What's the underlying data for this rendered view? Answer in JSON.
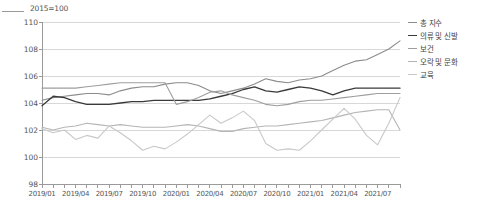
{
  "axis_note": "2015=100",
  "legend": {
    "position": "right-top",
    "items": [
      {
        "label": "총 지수",
        "color": "#8c8c8c"
      },
      {
        "label": "의류 및 신발",
        "color": "#3a3a3a"
      },
      {
        "label": "보건",
        "color": "#9e9e9e"
      },
      {
        "label": "오락 및 문화",
        "color": "#b5b5b5"
      },
      {
        "label": "교육",
        "color": "#c8c8c8"
      }
    ]
  },
  "chart_data": {
    "type": "line",
    "title": "",
    "subtitle": "",
    "xlabel": "",
    "ylabel": "2015=100",
    "ylim": [
      98,
      110
    ],
    "ytick_step": 2,
    "yticks": [
      98,
      100,
      102,
      104,
      106,
      108,
      110
    ],
    "grid": true,
    "legend_position": "right-top",
    "x": [
      "2019/01",
      "2019/02",
      "2019/03",
      "2019/04",
      "2019/05",
      "2019/06",
      "2019/07",
      "2019/08",
      "2019/09",
      "2019/10",
      "2019/11",
      "2019/12",
      "2020/01",
      "2020/02",
      "2020/03",
      "2020/04",
      "2020/05",
      "2020/06",
      "2020/07",
      "2020/08",
      "2020/09",
      "2020/10",
      "2020/11",
      "2020/12",
      "2021/01",
      "2021/02",
      "2021/03",
      "2021/04",
      "2021/05",
      "2021/06",
      "2021/07",
      "2021/08",
      "2021/09"
    ],
    "xtick_labels": [
      "2019/01",
      "2019/04",
      "2019/07",
      "2019/10",
      "2020/01",
      "2020/04",
      "2020/07",
      "2020/10",
      "2021/01",
      "2021/04",
      "2021/07"
    ],
    "series": [
      {
        "name": "총 지수",
        "color": "#8c8c8c",
        "width": 1.1,
        "values": [
          104.2,
          104.4,
          104.5,
          104.6,
          104.7,
          104.7,
          104.6,
          104.9,
          105.1,
          105.2,
          105.2,
          105.4,
          105.5,
          105.5,
          105.3,
          104.9,
          104.7,
          104.9,
          105.1,
          105.4,
          105.8,
          105.6,
          105.5,
          105.7,
          105.8,
          106.0,
          106.4,
          106.8,
          107.1,
          107.2,
          107.6,
          108.0,
          108.6
        ]
      },
      {
        "name": "의류 및 신발",
        "color": "#3a3a3a",
        "width": 1.3,
        "values": [
          103.8,
          104.5,
          104.4,
          104.1,
          103.9,
          103.9,
          103.9,
          104.0,
          104.1,
          104.1,
          104.2,
          104.2,
          104.2,
          104.2,
          104.2,
          104.3,
          104.5,
          104.7,
          105.0,
          105.2,
          104.9,
          104.8,
          105.0,
          105.2,
          105.1,
          104.9,
          104.6,
          104.9,
          105.1,
          105.1,
          105.1,
          105.1,
          105.1
        ]
      },
      {
        "name": "보건",
        "color": "#9e9e9e",
        "width": 1.1,
        "values": [
          105.1,
          105.1,
          105.1,
          105.1,
          105.2,
          105.3,
          105.4,
          105.5,
          105.5,
          105.5,
          105.5,
          105.5,
          103.9,
          104.1,
          104.4,
          104.8,
          104.9,
          104.6,
          104.4,
          104.2,
          103.9,
          103.8,
          103.9,
          104.1,
          104.2,
          104.2,
          104.3,
          104.4,
          104.5,
          104.6,
          104.7,
          104.7,
          104.7
        ]
      },
      {
        "name": "오락 및 문화",
        "color": "#b5b5b5",
        "width": 1.1,
        "values": [
          102.2,
          102.0,
          102.2,
          102.3,
          102.5,
          102.4,
          102.3,
          102.4,
          102.3,
          102.2,
          102.2,
          102.2,
          102.3,
          102.4,
          102.3,
          102.1,
          101.9,
          101.9,
          102.1,
          102.2,
          102.3,
          102.3,
          102.4,
          102.5,
          102.6,
          102.7,
          102.9,
          103.1,
          103.3,
          103.4,
          103.5,
          103.5,
          102.0
        ]
      },
      {
        "name": "교육",
        "color": "#c8c8c8",
        "width": 1.1,
        "values": [
          102.1,
          101.8,
          102.0,
          101.3,
          101.6,
          101.4,
          102.3,
          101.8,
          101.2,
          100.5,
          100.8,
          100.6,
          101.1,
          101.7,
          102.4,
          103.1,
          102.5,
          102.9,
          103.4,
          102.7,
          101.0,
          100.5,
          100.6,
          100.5,
          101.2,
          102.0,
          102.8,
          103.6,
          102.8,
          101.6,
          100.9,
          102.5,
          104.4
        ]
      }
    ]
  }
}
